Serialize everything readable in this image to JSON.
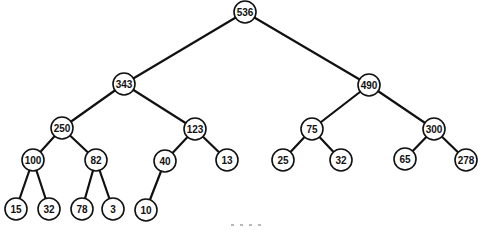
{
  "diagram": {
    "type": "binary-tree",
    "colors": {
      "background": "#ffffff",
      "stroke": "#111111",
      "node_fill": "#ffffff",
      "text": "#111111"
    },
    "node_radius": 11,
    "nodes": [
      {
        "id": "n536",
        "value": "536",
        "x": 245,
        "y": 12,
        "level": 0
      },
      {
        "id": "n343",
        "value": "343",
        "x": 124,
        "y": 84,
        "level": 1
      },
      {
        "id": "n490",
        "value": "490",
        "x": 369,
        "y": 85,
        "level": 1
      },
      {
        "id": "n250",
        "value": "250",
        "x": 62,
        "y": 128,
        "level": 2
      },
      {
        "id": "n123",
        "value": "123",
        "x": 195,
        "y": 129,
        "level": 2
      },
      {
        "id": "n75",
        "value": "75",
        "x": 312,
        "y": 129,
        "level": 2
      },
      {
        "id": "n300",
        "value": "300",
        "x": 434,
        "y": 129,
        "level": 2
      },
      {
        "id": "n100",
        "value": "100",
        "x": 33,
        "y": 160,
        "level": 3
      },
      {
        "id": "n82",
        "value": "82",
        "x": 96,
        "y": 160,
        "level": 3
      },
      {
        "id": "n40",
        "value": "40",
        "x": 165,
        "y": 161,
        "level": 3
      },
      {
        "id": "n13",
        "value": "13",
        "x": 227,
        "y": 160,
        "level": 3
      },
      {
        "id": "n25",
        "value": "25",
        "x": 283,
        "y": 160,
        "level": 3
      },
      {
        "id": "n32b",
        "value": "32",
        "x": 341,
        "y": 160,
        "level": 3
      },
      {
        "id": "n65",
        "value": "65",
        "x": 405,
        "y": 159,
        "level": 3
      },
      {
        "id": "n278",
        "value": "278",
        "x": 466,
        "y": 160,
        "level": 3
      },
      {
        "id": "n15",
        "value": "15",
        "x": 16,
        "y": 209,
        "level": 4
      },
      {
        "id": "n32a",
        "value": "32",
        "x": 49,
        "y": 209,
        "level": 4
      },
      {
        "id": "n78",
        "value": "78",
        "x": 82,
        "y": 209,
        "level": 4
      },
      {
        "id": "n3",
        "value": "3",
        "x": 113,
        "y": 209,
        "level": 4
      },
      {
        "id": "n10",
        "value": "10",
        "x": 146,
        "y": 210,
        "level": 4
      }
    ],
    "edges": [
      {
        "from": "n536",
        "to": "n343"
      },
      {
        "from": "n536",
        "to": "n490"
      },
      {
        "from": "n343",
        "to": "n250"
      },
      {
        "from": "n343",
        "to": "n123"
      },
      {
        "from": "n490",
        "to": "n75"
      },
      {
        "from": "n490",
        "to": "n300"
      },
      {
        "from": "n250",
        "to": "n100"
      },
      {
        "from": "n250",
        "to": "n82"
      },
      {
        "from": "n123",
        "to": "n40"
      },
      {
        "from": "n123",
        "to": "n13"
      },
      {
        "from": "n75",
        "to": "n25"
      },
      {
        "from": "n75",
        "to": "n32b"
      },
      {
        "from": "n300",
        "to": "n65"
      },
      {
        "from": "n300",
        "to": "n278"
      },
      {
        "from": "n100",
        "to": "n15"
      },
      {
        "from": "n100",
        "to": "n32a"
      },
      {
        "from": "n82",
        "to": "n78"
      },
      {
        "from": "n82",
        "to": "n3"
      },
      {
        "from": "n40",
        "to": "n10"
      }
    ]
  }
}
